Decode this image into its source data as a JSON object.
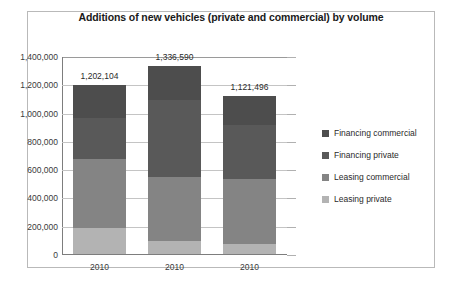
{
  "chart_data": {
    "type": "bar",
    "stacked": true,
    "title": "Additions of new vehicles (private and commercial) by volume",
    "xlabel": "",
    "ylabel": "",
    "categories": [
      "2010",
      "2010",
      "2010"
    ],
    "ylim": [
      0,
      1400000
    ],
    "ytick_labels": [
      "1,400,000",
      "1,200,000",
      "1,000,000",
      "800,000",
      "600,000",
      "400,000",
      "200,000",
      "0"
    ],
    "ytick_values": [
      1400000,
      1200000,
      1000000,
      800000,
      600000,
      400000,
      200000,
      0
    ],
    "grid": true,
    "legend_position": "right",
    "series": [
      {
        "name": "Financing commercial",
        "color": "#4d4d4d",
        "values": [
          230000,
          240000,
          200000
        ]
      },
      {
        "name": "Financing private",
        "color": "#595959",
        "values": [
          292104,
          546590,
          385496
        ]
      },
      {
        "name": "Leasing commercial",
        "color": "#848484",
        "values": [
          490000,
          450000,
          460000
        ]
      },
      {
        "name": "Leasing private",
        "color": "#b3b3b3",
        "values": [
          190000,
          100000,
          76000
        ]
      }
    ],
    "totals": [
      1202104,
      1336590,
      1121496
    ],
    "total_labels": [
      "1,202,104",
      "1,336,590",
      "1,121,496"
    ]
  },
  "colors": {
    "frame_border": "#b9b9b9",
    "gridline": "#c4c4c4",
    "axis": "#7d7d7d",
    "text": "#2a2a2a"
  }
}
